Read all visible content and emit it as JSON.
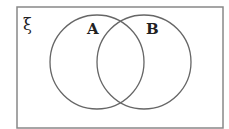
{
  "diagram": {
    "type": "venn",
    "universal_set_symbol": "ξ",
    "sets": [
      {
        "label": "A"
      },
      {
        "label": "B"
      }
    ],
    "stroke_color": "#666666",
    "background": "#ffffff"
  }
}
